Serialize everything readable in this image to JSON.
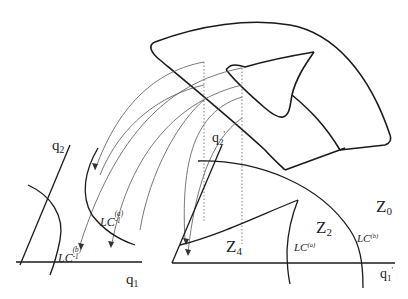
{
  "diagram": {
    "type": "dynamical-systems-schematic",
    "left_plane": {
      "axis_x": "q",
      "axis_x_sub": "1",
      "axis_y": "q",
      "axis_y_sub": "2",
      "curve_a": {
        "base": "LC",
        "sub": "-1",
        "sup": "(a)"
      },
      "curve_b": {
        "base": "LC",
        "sub": "-1",
        "sup": "(b)"
      }
    },
    "right_plane": {
      "axis_x": "q",
      "axis_x_sub": "1",
      "axis_x_prime": "'",
      "axis_y": "q",
      "axis_y_sub": "2",
      "axis_y_prime": "'",
      "curve_a": {
        "base": "LC",
        "sup": "(a)"
      },
      "curve_b": {
        "base": "LC",
        "sup": "(b)"
      },
      "zones": [
        {
          "base": "Z",
          "sub": "0"
        },
        {
          "base": "Z",
          "sub": "2"
        },
        {
          "base": "Z",
          "sub": "4"
        }
      ]
    },
    "colors": {
      "line": "#1a1a1a",
      "thin": "#555555",
      "dotted": "#777777"
    }
  }
}
